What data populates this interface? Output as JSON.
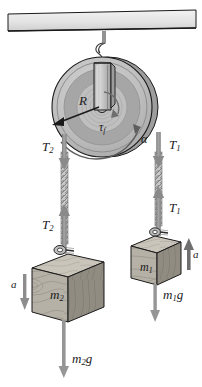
{
  "figure": {
    "type": "physics-free-body-diagram"
  },
  "ceiling": {
    "name": "support-beam"
  },
  "pulley": {
    "radius_label": "R",
    "friction_torque_label_main": "τ",
    "friction_torque_label_sub": "f",
    "angular_accel_label": "α"
  },
  "left_side": {
    "tension_top_main": "T",
    "tension_top_sub": "2",
    "tension_bottom_main": "T",
    "tension_bottom_sub": "2",
    "block_label_main": "m",
    "block_label_sub": "2",
    "accel_label": "a",
    "weight_main": "m",
    "weight_sub": "2",
    "weight_tail": "g"
  },
  "right_side": {
    "tension_top_main": "T",
    "tension_top_sub": "1",
    "tension_bottom_main": "T",
    "tension_bottom_sub": "1",
    "block_label_main": "m",
    "block_label_sub": "1",
    "accel_label": "a",
    "weight_main": "m",
    "weight_sub": "1",
    "weight_tail": "g"
  },
  "colors": {
    "outline": "#1a1a1a",
    "arrow_gray": "#8a8a8a",
    "rope_gray": "#9a9a9a",
    "wood_face": "#b5b0a6",
    "wood_top": "#c9c4ba",
    "wood_side": "#8f8a80",
    "pulley_outer": "#c2c2c2",
    "pulley_mid": "#a5a5a5",
    "pulley_inner": "#bdbdbd",
    "beam_fill": "#e2e2e2"
  }
}
